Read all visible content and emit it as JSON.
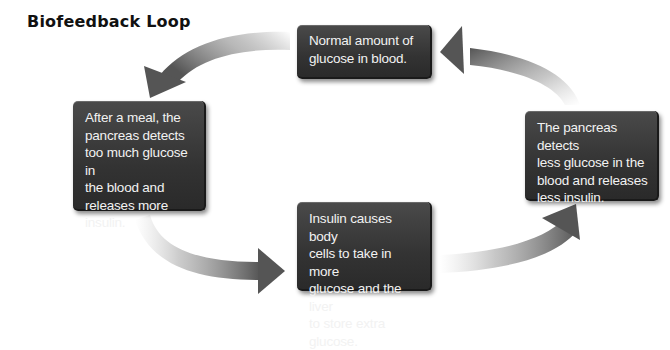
{
  "title": "Biofeedback Loop",
  "boxes": {
    "top": "Normal amount of\nglucose in blood.",
    "left": "After a meal, the\npancreas detects\ntoo much glucose in\nthe blood and\nreleases more insulin.",
    "right": "The pancreas detects\nless glucose in the\nblood and releases\nless insulin.",
    "bottom": "Insulin causes body\ncells to take in more\nglucose and the liver\nto store extra glucose."
  },
  "arrows": [
    {
      "from": "top",
      "to": "left",
      "direction": "counter-clockwise"
    },
    {
      "from": "left",
      "to": "bottom",
      "direction": "counter-clockwise"
    },
    {
      "from": "bottom",
      "to": "right",
      "direction": "counter-clockwise"
    },
    {
      "from": "right",
      "to": "top",
      "direction": "counter-clockwise"
    }
  ],
  "colors": {
    "box_fill": "#333333",
    "box_text": "#f2f2f2",
    "arrow": "#5a5a5a",
    "title": "#111111"
  }
}
